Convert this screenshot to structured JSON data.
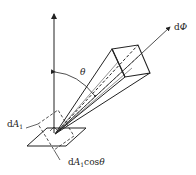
{
  "diagram": {
    "labels": {
      "flux": {
        "prefix": "d",
        "symbol": "Φ"
      },
      "theta": "θ",
      "area": {
        "prefix": "d",
        "symbol": "A",
        "sub": "1"
      },
      "projected_area": {
        "prefix": "d",
        "symbol": "A",
        "sub": "1",
        "suffix": "cos",
        "angle": "θ"
      }
    },
    "colors": {
      "line": "#222222",
      "background": "#ffffff"
    }
  }
}
